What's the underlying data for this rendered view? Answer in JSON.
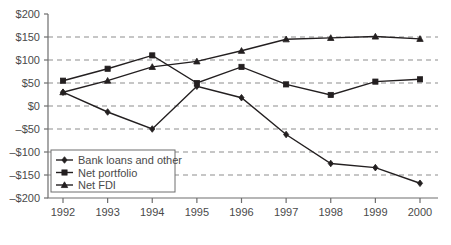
{
  "chart_data": {
    "type": "line",
    "title": "",
    "xlabel": "",
    "ylabel": "",
    "categories": [
      "1992",
      "1993",
      "1994",
      "1995",
      "1996",
      "1997",
      "1998",
      "1999",
      "2000"
    ],
    "x": [
      1992,
      1993,
      1994,
      1995,
      1996,
      1997,
      1998,
      1999,
      2000
    ],
    "ylim": [
      -200,
      200
    ],
    "xlim": [
      1992,
      2000
    ],
    "grid": true,
    "grid_axis": "y",
    "legend_position": "bottom-left",
    "y_tick_values": [
      200,
      150,
      100,
      50,
      0,
      -50,
      -100,
      -150,
      -200
    ],
    "y_tick_labels": [
      "$200",
      "$150",
      "$100",
      "$50",
      "$0",
      "–$50",
      "–$100",
      "–$150",
      "–$200"
    ],
    "x_tick_labels": [
      "1992",
      "1993",
      "1994",
      "1995",
      "1996",
      "1997",
      "1998",
      "1999",
      "2000"
    ],
    "series": [
      {
        "name": "Bank loans and other",
        "marker": "diamond",
        "color": "#231f20",
        "values": [
          30,
          -13,
          -50,
          43,
          18,
          -62,
          -125,
          -134,
          -168
        ]
      },
      {
        "name": "Net portfolio",
        "marker": "square",
        "color": "#231f20",
        "values": [
          55,
          81,
          110,
          50,
          85,
          47,
          24,
          53,
          58
        ]
      },
      {
        "name": "Net FDI",
        "marker": "triangle",
        "color": "#231f20",
        "values": [
          30,
          55,
          85,
          97,
          120,
          145,
          148,
          151,
          146
        ]
      }
    ]
  },
  "legend": {
    "items": [
      {
        "label": "Bank loans and other",
        "marker": "diamond"
      },
      {
        "label": "Net portfolio",
        "marker": "square"
      },
      {
        "label": "Net FDI",
        "marker": "triangle"
      }
    ]
  },
  "caption": {
    "text": ""
  },
  "colors": {
    "ink": "#231f20",
    "axis": "#6e6e6e",
    "grid": "#8d8d8d",
    "text": "#4a4a4a",
    "background": "#ffffff"
  }
}
